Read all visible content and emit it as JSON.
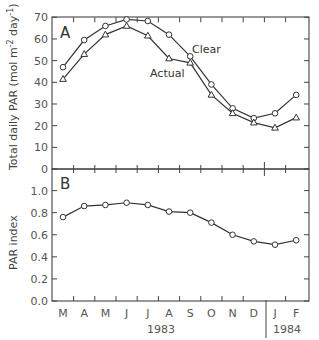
{
  "chart_data": [
    {
      "panel": "A",
      "type": "line",
      "title": "",
      "xlabel": "",
      "ylabel": "Total daily PAR (mol m⁻² day⁻¹)",
      "ylim": [
        0,
        70
      ],
      "yticks": [
        0,
        10,
        20,
        30,
        40,
        50,
        60,
        70
      ],
      "categories": [
        "M",
        "A",
        "M",
        "J",
        "J",
        "A",
        "S",
        "O",
        "N",
        "D",
        "J",
        "F"
      ],
      "series": [
        {
          "name": "Clear",
          "marker": "circle",
          "values": [
            47,
            59.5,
            66,
            69,
            68.3,
            62,
            52,
            39,
            28,
            23.5,
            25.7,
            34.2
          ]
        },
        {
          "name": "Actual",
          "marker": "triangle",
          "values": [
            41.5,
            53,
            62,
            66,
            61.5,
            51,
            49,
            34.2,
            25.7,
            21.4,
            19,
            23.7
          ]
        }
      ],
      "grid": false,
      "legend": "inline labels"
    },
    {
      "panel": "B",
      "type": "line",
      "title": "",
      "xlabel": "",
      "ylabel": "PAR index",
      "ylim": [
        0.0,
        1.1
      ],
      "yticks": [
        "0.0",
        "0.2",
        "0.4",
        "0.6",
        "0.8",
        "1.0"
      ],
      "categories": [
        "M",
        "A",
        "M",
        "J",
        "J",
        "A",
        "S",
        "O",
        "N",
        "D",
        "J",
        "F"
      ],
      "x_year_labels": [
        {
          "label": "1983",
          "months": "M-D"
        },
        {
          "label": "1984",
          "months": "J-F"
        }
      ],
      "series": [
        {
          "name": "PAR index",
          "marker": "circle",
          "values": [
            0.76,
            0.86,
            0.87,
            0.89,
            0.87,
            0.81,
            0.8,
            0.71,
            0.6,
            0.54,
            0.51,
            0.55
          ]
        }
      ],
      "grid": false
    }
  ],
  "labels": {
    "panel_a": "A",
    "panel_b": "B",
    "clear": "Clear",
    "actual": "Actual",
    "ylabel_a": "Total daily PAR (mol m",
    "ylabel_a_sup1": "-2",
    "ylabel_a_mid": " day",
    "ylabel_a_sup2": "-1",
    "ylabel_a_end": ")",
    "ylabel_b": "PAR index",
    "year_1983": "1983",
    "year_1984": "1984"
  }
}
